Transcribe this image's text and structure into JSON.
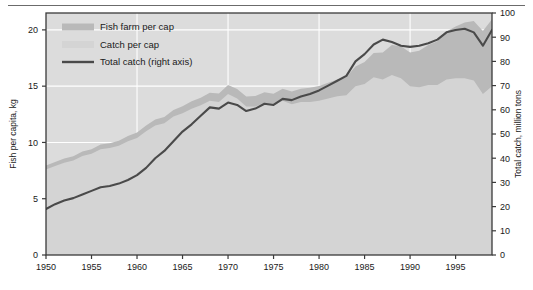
{
  "figure": {
    "top_rule": true,
    "background": "#ffffff",
    "plot_background": "#dcdcdc"
  },
  "colors": {
    "fish_farm_band": "#b9b9b9",
    "catch_band": "#d4d4d4",
    "total_catch_line": "#4a4a4a",
    "gridline": "#ffffff",
    "axis": "#3a3a3a",
    "plot_bg": "#dcdcdc"
  },
  "legend": {
    "items": [
      {
        "label": "Fish farm per cap",
        "swatch": "band",
        "color": "#b9b9b9"
      },
      {
        "label": "Catch per cap",
        "swatch": "band",
        "color": "#d4d4d4"
      },
      {
        "label": "Total catch (right axis)",
        "swatch": "line",
        "color": "#4a4a4a"
      }
    ]
  },
  "chart_data": {
    "type": "area",
    "title": "",
    "xlabel": "",
    "ylabel": "Fish per capita, kg",
    "y2label": "Total catch, million tons",
    "xlim": [
      1950,
      1999
    ],
    "ylim": [
      0,
      21.5
    ],
    "y2lim": [
      0,
      100
    ],
    "grid": true,
    "legend_position": "top-left",
    "xticks": [
      1950,
      1955,
      1960,
      1965,
      1970,
      1975,
      1980,
      1985,
      1990,
      1995
    ],
    "xticklabels": [
      "1950",
      "1955",
      "1960",
      "1965",
      "1970",
      "1975",
      "1980",
      "1985",
      "1990",
      "1995"
    ],
    "yticks": [
      0,
      5,
      10,
      15,
      20
    ],
    "yticklabels": [
      "0",
      "5",
      "10",
      "15",
      "20"
    ],
    "y2ticks": [
      0,
      10,
      20,
      30,
      40,
      50,
      60,
      70,
      80,
      90,
      100
    ],
    "y2ticklabels": [
      "0",
      "10",
      "20",
      "30",
      "40",
      "50",
      "60",
      "70",
      "80",
      "90",
      "100"
    ],
    "x": [
      1950,
      1951,
      1952,
      1953,
      1954,
      1955,
      1956,
      1957,
      1958,
      1959,
      1960,
      1961,
      1962,
      1963,
      1964,
      1965,
      1966,
      1967,
      1968,
      1969,
      1970,
      1971,
      1972,
      1973,
      1974,
      1975,
      1976,
      1977,
      1978,
      1979,
      1980,
      1981,
      1982,
      1983,
      1984,
      1985,
      1986,
      1987,
      1988,
      1989,
      1990,
      1991,
      1992,
      1993,
      1994,
      1995,
      1996,
      1997,
      1998,
      1999
    ],
    "series": [
      {
        "name": "Catch per cap",
        "axis": "left",
        "units": "kg",
        "values": [
          7.6,
          7.9,
          8.2,
          8.4,
          8.8,
          9.0,
          9.4,
          9.5,
          9.7,
          10.1,
          10.4,
          11.0,
          11.5,
          11.7,
          12.3,
          12.6,
          13.0,
          13.3,
          13.7,
          13.6,
          14.3,
          13.9,
          13.2,
          13.2,
          13.5,
          13.3,
          13.7,
          13.4,
          13.6,
          13.6,
          13.7,
          13.9,
          14.1,
          14.2,
          15.0,
          15.2,
          15.8,
          15.6,
          16.0,
          15.7,
          15.0,
          14.9,
          15.1,
          15.1,
          15.6,
          15.7,
          15.7,
          15.5,
          14.3,
          15.0
        ]
      },
      {
        "name": "Fish farm per cap",
        "axis": "left",
        "units": "kg",
        "values": [
          0.35,
          0.36,
          0.37,
          0.38,
          0.39,
          0.4,
          0.42,
          0.43,
          0.45,
          0.47,
          0.49,
          0.51,
          0.54,
          0.56,
          0.59,
          0.62,
          0.65,
          0.68,
          0.72,
          0.75,
          0.8,
          0.84,
          0.88,
          0.92,
          0.97,
          1.02,
          1.07,
          1.12,
          1.18,
          1.25,
          1.32,
          1.4,
          1.5,
          1.62,
          1.75,
          1.95,
          2.15,
          2.4,
          2.65,
          2.85,
          3.0,
          3.25,
          3.55,
          3.9,
          4.25,
          4.6,
          4.95,
          5.3,
          5.6,
          5.95
        ]
      },
      {
        "name": "Total fish per cap (stacked total)",
        "axis": "left",
        "units": "kg",
        "values": [
          7.95,
          8.26,
          8.57,
          8.78,
          9.19,
          9.4,
          9.82,
          9.93,
          10.15,
          10.57,
          10.89,
          11.51,
          12.04,
          12.26,
          12.89,
          13.22,
          13.65,
          13.98,
          14.42,
          14.35,
          15.1,
          14.74,
          14.08,
          14.12,
          14.47,
          14.32,
          14.77,
          14.52,
          14.78,
          14.85,
          15.02,
          15.3,
          15.6,
          15.82,
          16.75,
          17.15,
          17.95,
          18.0,
          18.65,
          18.55,
          18.0,
          18.15,
          18.65,
          19.0,
          19.85,
          20.3,
          20.65,
          20.8,
          19.9,
          20.95
        ]
      },
      {
        "name": "Total catch (right axis)",
        "axis": "right",
        "units": "million tons",
        "values": [
          19.0,
          21.0,
          22.5,
          23.5,
          25.0,
          26.5,
          28.0,
          28.5,
          29.5,
          31.0,
          33.0,
          36.0,
          40.0,
          43.0,
          47.0,
          51.0,
          54.0,
          57.5,
          61.0,
          60.5,
          63.0,
          62.0,
          59.5,
          60.5,
          62.5,
          62.0,
          64.5,
          64.0,
          65.5,
          66.5,
          68.0,
          70.0,
          72.0,
          74.0,
          80.0,
          83.0,
          87.0,
          89.0,
          88.0,
          86.5,
          86.0,
          86.5,
          87.5,
          89.0,
          92.0,
          93.0,
          93.5,
          92.0,
          86.5,
          93.0
        ]
      }
    ]
  }
}
